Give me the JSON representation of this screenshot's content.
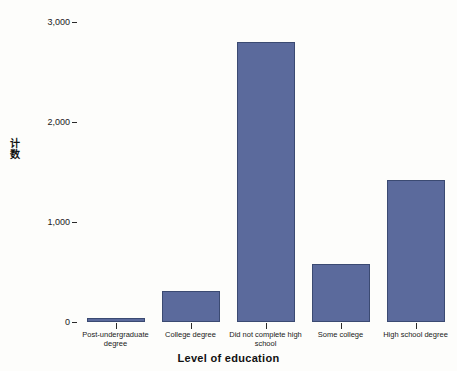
{
  "chart_data": {
    "type": "bar",
    "title": "",
    "xlabel": "Level of education",
    "ylabel": "计数",
    "categories": [
      "Post-undergraduate degree",
      "College degree",
      "Did not complete high school",
      "Some college",
      "High school degree"
    ],
    "values": [
      40,
      310,
      2800,
      580,
      1420
    ],
    "ylim": [
      0,
      3000
    ],
    "yticks": [
      0,
      1000,
      2000,
      3000
    ],
    "ytick_labels": [
      "0",
      "1,000",
      "2,000",
      "3,000"
    ],
    "grid": false,
    "legend": null,
    "bar_color": "#5b6a9c",
    "bar_edge_color": "#3b4a72",
    "background_color": "#fdfdfb"
  },
  "axes": {
    "y_title_chars": [
      "计",
      "数"
    ]
  }
}
